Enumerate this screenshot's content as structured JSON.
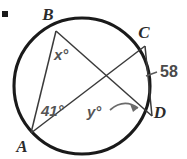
{
  "figure": {
    "background_color": "#ffffff",
    "stroke_color": "#1a1a1a",
    "label_color": "#555555",
    "vertex_color": "#2b2b2b"
  },
  "vertices": [
    {
      "id": "B",
      "label": "B",
      "x": 48,
      "y": 20
    },
    {
      "id": "C",
      "label": "C",
      "x": 144,
      "y": 38
    },
    {
      "id": "D",
      "label": "D",
      "x": 160,
      "y": 118
    },
    {
      "id": "A",
      "label": "A",
      "x": 22,
      "y": 152
    }
  ],
  "angles": [
    {
      "id": "x",
      "label": "x°",
      "x": 54,
      "y": 60,
      "at_vertex": "B"
    },
    {
      "id": "41",
      "label": "41°",
      "x": 41,
      "y": 116,
      "at_vertex": "A"
    },
    {
      "id": "y",
      "label": "y°",
      "x": 87,
      "y": 117,
      "at_vertex": "intersection"
    }
  ],
  "arc_measures": [
    {
      "id": "arc-CD",
      "label": "58",
      "x": 160,
      "y": 77,
      "arc": "CD"
    }
  ],
  "corner_mark": {
    "id": "corner-tick",
    "x": 2,
    "y": 11,
    "width": 6,
    "height": 6
  },
  "circle": {
    "cx": 82,
    "cy": 86,
    "r": 68
  },
  "chord_segments": [
    {
      "id": "chord-BD",
      "from": "B",
      "to": "D"
    },
    {
      "id": "chord-AC",
      "from": "A",
      "to": "C"
    },
    {
      "id": "chord-AB",
      "from": "A",
      "to": "B"
    },
    {
      "id": "chord-CD",
      "from": "C",
      "to": "D"
    }
  ]
}
